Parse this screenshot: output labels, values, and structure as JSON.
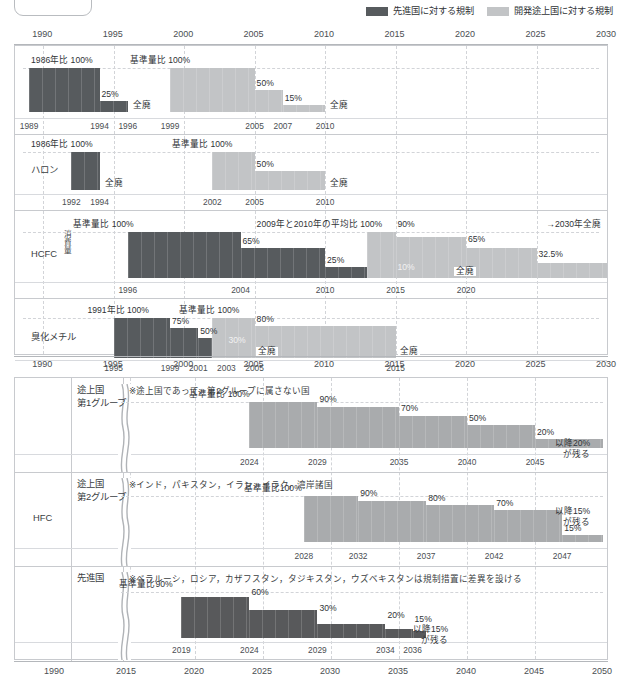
{
  "legend": {
    "items": [
      {
        "label": "先進国に対する規制",
        "color": "#575b5e",
        "name": "developed-countries"
      },
      {
        "label": "開発途上国に対する規制",
        "color": "#c2c4c6",
        "name": "developing-countries"
      }
    ]
  },
  "top_panel": {
    "axis_top": {
      "ticks": [
        "1990",
        "1995",
        "2000",
        "2005",
        "2010",
        "2015",
        "2020",
        "2025",
        "2030"
      ]
    },
    "axis_bottom": {
      "ticks": [
        "1990",
        "1995",
        "2000",
        "2005",
        "2010",
        "2015",
        "2020",
        "2025",
        "2030"
      ]
    },
    "rows": [
      {
        "label": "CFC5種",
        "baseline_dev": "1986年比 100%",
        "baseline_ing": "基準量比 100%",
        "steps_dev": [
          "100%",
          "25%",
          "全廃"
        ],
        "steps_ing": [
          "100%",
          "50%",
          "15%",
          "全廃"
        ],
        "labels": [
          "25%",
          "全廃",
          "50%",
          "15%",
          "全廃"
        ],
        "years": [
          "1989",
          "1994",
          "1996",
          "1999",
          "2005",
          "2007",
          "2010"
        ]
      },
      {
        "label": "ハロン",
        "baseline_dev": "1986年比 100%",
        "baseline_ing": "基準量比 100%",
        "labels": [
          "全廃",
          "50%",
          "全廃"
        ],
        "years": [
          "1992",
          "1994",
          "2002",
          "2005",
          "2010"
        ]
      },
      {
        "label": "HCFC",
        "vertical_label": "消費量",
        "baseline_dev": "基準量比 100%",
        "baseline_ing": "2009年と2010年の平均比 100%",
        "annotation": "→2030年全廃",
        "labels": [
          "65%",
          "25%",
          "10%",
          "全廃",
          "90%",
          "65%",
          "32.5%"
        ],
        "years": [
          "1996",
          "2004",
          "2010",
          "2015",
          "2020"
        ]
      },
      {
        "label": "臭化メチル",
        "baseline_dev": "1991年比 100%",
        "baseline_ing": "基準量比 100%",
        "labels": [
          "75%",
          "50%",
          "30%",
          "全廃",
          "80%",
          "全廃"
        ],
        "years": [
          "1995",
          "1999",
          "2001",
          "2003",
          "2005",
          "2015"
        ]
      }
    ]
  },
  "bottom_panel": {
    "group_label": "HFC",
    "axis_bottom": {
      "ticks": [
        "1990",
        "2015",
        "2020",
        "2025",
        "2030",
        "2035",
        "2040",
        "2045",
        "2050"
      ]
    },
    "rows": [
      {
        "label": "途上国\n第1グループ",
        "note": "※途上国であって，第2グループに属さない国",
        "baseline": "基準量比 100%",
        "labels": [
          "90%",
          "70%",
          "50%",
          "20%"
        ],
        "tail_note": "以降20%\nが残る",
        "years": [
          "2024",
          "2029",
          "2035",
          "2040",
          "2045"
        ]
      },
      {
        "label": "途上国\n第2グループ",
        "note": "※インド，パキスタン，イラン，イラク，湾岸諸国",
        "baseline": "基準量比100%",
        "labels": [
          "90%",
          "80%",
          "70%",
          "15%"
        ],
        "tail_note": "以降15%\nが残る",
        "years": [
          "2028",
          "2032",
          "2037",
          "2042",
          "2047"
        ]
      },
      {
        "label": "先進国",
        "note": "※ベラルーシ，ロシア，カザフスタン，タジキスタン，ウズベキスタンは規制措置に差異を設ける",
        "baseline": "基準量比90%",
        "labels": [
          "60%",
          "30%",
          "20%",
          "15%"
        ],
        "tail_note": "以降15%\nが残る",
        "years": [
          "2019",
          "2024",
          "2029",
          "2034",
          "2036"
        ]
      }
    ]
  },
  "chart_data": {
    "type": "area",
    "xlabel": "年",
    "ylabel": "消費量",
    "legend": [
      "先進国に対する規制",
      "開発途上国に対する規制"
    ],
    "panels": [
      {
        "name": "ozone-depleting-substances",
        "xlim": [
          1988,
          2030
        ],
        "xticks": [
          1990,
          1995,
          2000,
          2005,
          2010,
          2015,
          2020,
          2025,
          2030
        ],
        "series": [
          {
            "name": "CFC5種 先進国",
            "baseline": "1986年比 100%",
            "steps": [
              {
                "year": 1989,
                "value": 100
              },
              {
                "year": 1994,
                "value": 25
              },
              {
                "year": 1996,
                "value": 0,
                "label": "全廃"
              }
            ]
          },
          {
            "name": "CFC5種 開発途上国",
            "baseline": "基準量比 100%",
            "steps": [
              {
                "year": 1999,
                "value": 100
              },
              {
                "year": 2005,
                "value": 50
              },
              {
                "year": 2007,
                "value": 15
              },
              {
                "year": 2010,
                "value": 0,
                "label": "全廃"
              }
            ]
          },
          {
            "name": "ハロン 先進国",
            "baseline": "1986年比 100%",
            "steps": [
              {
                "year": 1992,
                "value": 100
              },
              {
                "year": 1994,
                "value": 0,
                "label": "全廃"
              }
            ]
          },
          {
            "name": "ハロン 開発途上国",
            "baseline": "基準量比 100%",
            "steps": [
              {
                "year": 2002,
                "value": 100
              },
              {
                "year": 2005,
                "value": 50
              },
              {
                "year": 2010,
                "value": 0,
                "label": "全廃"
              }
            ]
          },
          {
            "name": "HCFC 先進国",
            "baseline": "基準量比 100%",
            "steps": [
              {
                "year": 1996,
                "value": 100
              },
              {
                "year": 2004,
                "value": 65
              },
              {
                "year": 2010,
                "value": 25
              },
              {
                "year": 2015,
                "value": 10
              },
              {
                "year": 2020,
                "value": 0,
                "label": "全廃"
              }
            ]
          },
          {
            "name": "HCFC 開発途上国",
            "baseline": "2009年と2010年の平均比 100%",
            "annotation": "→2030年全廃",
            "steps": [
              {
                "year": 2013,
                "value": 100
              },
              {
                "year": 2015,
                "value": 90
              },
              {
                "year": 2020,
                "value": 65
              },
              {
                "year": 2025,
                "value": 32.5
              }
            ]
          },
          {
            "name": "臭化メチル 先進国",
            "baseline": "1991年比 100%",
            "steps": [
              {
                "year": 1995,
                "value": 100
              },
              {
                "year": 1999,
                "value": 75
              },
              {
                "year": 2001,
                "value": 50
              },
              {
                "year": 2003,
                "value": 30
              },
              {
                "year": 2005,
                "value": 0,
                "label": "全廃"
              }
            ]
          },
          {
            "name": "臭化メチル 開発途上国",
            "baseline": "基準量比 100%",
            "steps": [
              {
                "year": 2002,
                "value": 100
              },
              {
                "year": 2005,
                "value": 80
              },
              {
                "year": 2015,
                "value": 0,
                "label": "全廃"
              }
            ]
          }
        ]
      },
      {
        "name": "hfc",
        "xlim": [
          2015,
          2050
        ],
        "xticks": [
          1990,
          2015,
          2020,
          2025,
          2030,
          2035,
          2040,
          2045,
          2050
        ],
        "axis_break_after": 1990,
        "series": [
          {
            "name": "途上国第1グループ",
            "baseline": "基準量比 100%",
            "steps": [
              {
                "year": 2024,
                "value": 100
              },
              {
                "year": 2029,
                "value": 90
              },
              {
                "year": 2035,
                "value": 70
              },
              {
                "year": 2040,
                "value": 50
              },
              {
                "year": 2045,
                "value": 20
              }
            ],
            "tail": "以降20%が残る"
          },
          {
            "name": "途上国第2グループ",
            "baseline": "基準量比100%",
            "steps": [
              {
                "year": 2028,
                "value": 100
              },
              {
                "year": 2032,
                "value": 90
              },
              {
                "year": 2037,
                "value": 80
              },
              {
                "year": 2042,
                "value": 70
              },
              {
                "year": 2047,
                "value": 15
              }
            ],
            "tail": "以降15%が残る"
          },
          {
            "name": "先進国",
            "baseline": "基準量比90%",
            "steps": [
              {
                "year": 2019,
                "value": 90
              },
              {
                "year": 2024,
                "value": 60
              },
              {
                "year": 2029,
                "value": 30
              },
              {
                "year": 2034,
                "value": 20
              },
              {
                "year": 2036,
                "value": 15
              }
            ],
            "tail": "以降15%が残る"
          }
        ]
      }
    ]
  }
}
